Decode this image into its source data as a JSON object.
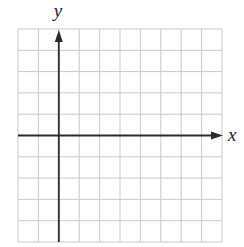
{
  "diagram": {
    "type": "coordinate-plane",
    "grid": {
      "columns": 10,
      "rows": 10,
      "left": 18,
      "top": 29,
      "right": 222,
      "bottom": 242,
      "line_color": "#c9c9c9"
    },
    "axes": {
      "color": "#2a2a2a",
      "x_axis": {
        "label": "x",
        "row_from_top": 5
      },
      "y_axis": {
        "label": "y",
        "column_from_left": 2
      }
    }
  }
}
